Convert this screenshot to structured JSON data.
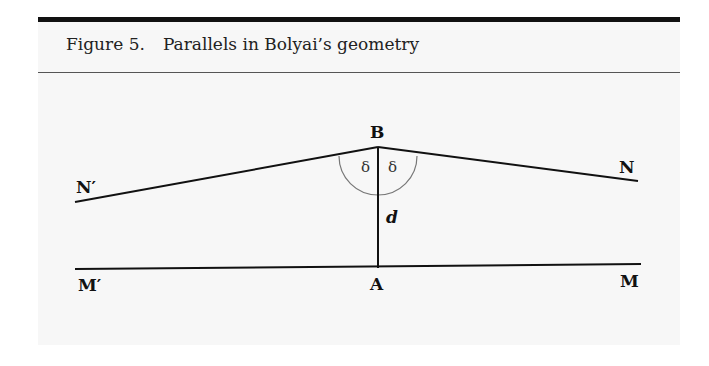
{
  "figure": {
    "number_label": "Figure 5.",
    "title": "Parallels in Bolyai’s geometry"
  },
  "diagram": {
    "points": {
      "B": {
        "label": "B",
        "x": 378,
        "y": 147
      },
      "A": {
        "label": "A",
        "x": 378,
        "y": 268
      },
      "N_prime": {
        "label": "N′",
        "x": 75,
        "y": 202
      },
      "N": {
        "label": "N",
        "x": 638,
        "y": 181
      },
      "M_prime": {
        "label": "M′",
        "x": 75,
        "y": 269
      },
      "M": {
        "label": "M",
        "x": 641,
        "y": 264
      }
    },
    "segment_label": "d",
    "angle_labels": [
      "δ",
      "δ"
    ]
  }
}
